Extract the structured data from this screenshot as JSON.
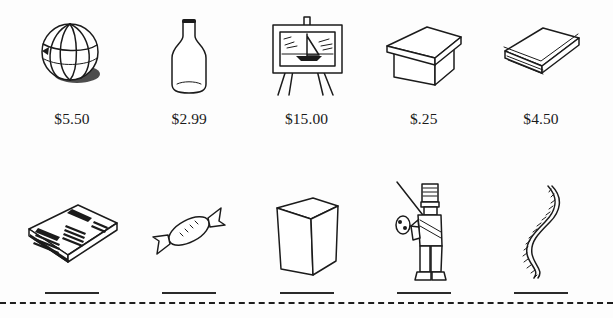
{
  "worksheet": {
    "title": "Money worksheet — item prices and blanks",
    "cut_line": "dashed-cut-line"
  },
  "rows": [
    {
      "id": "priced-row",
      "items": [
        {
          "icon": "beach-ball-icon",
          "name": "beach ball",
          "price": "$5.50"
        },
        {
          "icon": "bottle-icon",
          "name": "bottle",
          "price": "$2.99"
        },
        {
          "icon": "painting-easel-icon",
          "name": "painting",
          "price": "$15.00"
        },
        {
          "icon": "box-with-lid-icon",
          "name": "box",
          "price": "$.25"
        },
        {
          "icon": "book-icon",
          "name": "book",
          "price": "$4.50"
        }
      ]
    },
    {
      "id": "blank-row",
      "items": [
        {
          "icon": "newspaper-icon",
          "name": "newspaper",
          "price": ""
        },
        {
          "icon": "candy-icon",
          "name": "candy",
          "price": ""
        },
        {
          "icon": "carton-box-icon",
          "name": "carton",
          "price": ""
        },
        {
          "icon": "toy-soldier-icon",
          "name": "toy soldier",
          "price": ""
        },
        {
          "icon": "rope-icon",
          "name": "rope",
          "price": ""
        }
      ]
    }
  ],
  "colors": {
    "ink": "#1b1b1b",
    "paper": "#ffffff",
    "rule": "#2a2a2a"
  }
}
